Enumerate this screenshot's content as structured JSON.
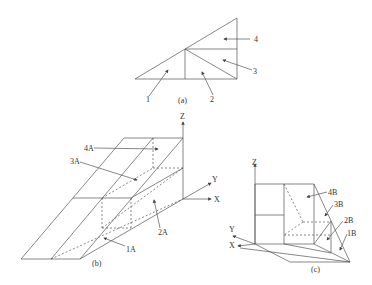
{
  "figure": {
    "panel_a": {
      "caption": "(a)",
      "region_labels": [
        "1",
        "2",
        "3",
        "4"
      ]
    },
    "panel_b": {
      "caption": "(b)",
      "axes": {
        "z": "Z",
        "y": "Y",
        "x": "X"
      },
      "region_labels": [
        "4A",
        "3A",
        "2A",
        "1A"
      ]
    },
    "panel_c": {
      "caption": "(c)",
      "axes": {
        "z": "Z",
        "y": "Y",
        "x": "X"
      },
      "region_labels": [
        "4B",
        "3B",
        "2B",
        "1B"
      ]
    }
  },
  "colors": {
    "line": "#555555",
    "background": "#ffffff"
  }
}
